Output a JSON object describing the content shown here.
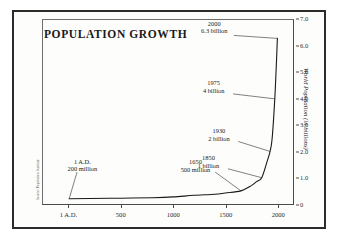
{
  "chart_data": {
    "type": "line",
    "title": "POPULATION GROWTH",
    "xlabel": "",
    "ylabel": "World Population (in billions)",
    "xlim": [
      -250,
      2150
    ],
    "ylim": [
      0,
      7.0
    ],
    "grid": false,
    "legend_position": "none",
    "x_ticks": [
      {
        "value": 1,
        "label": "1 A.D."
      },
      {
        "value": 500,
        "label": "500"
      },
      {
        "value": 1000,
        "label": "1000"
      },
      {
        "value": 1500,
        "label": "1500"
      },
      {
        "value": 2000,
        "label": "2000"
      }
    ],
    "y_ticks": [
      {
        "value": 0,
        "label": "0"
      },
      {
        "value": 1.0,
        "label": "1.0"
      },
      {
        "value": 2.0,
        "label": "2.0"
      },
      {
        "value": 3.0,
        "label": "3.0"
      },
      {
        "value": 4.0,
        "label": "4.0"
      },
      {
        "value": 5.0,
        "label": "5.0"
      },
      {
        "value": 6.0,
        "label": "6.0"
      },
      {
        "value": 7.0,
        "label": "7.0"
      }
    ],
    "series": [
      {
        "name": "World Population",
        "units": "billions",
        "points": [
          {
            "x": 1,
            "y": 0.2
          },
          {
            "x": 200,
            "y": 0.21
          },
          {
            "x": 500,
            "y": 0.22
          },
          {
            "x": 800,
            "y": 0.24
          },
          {
            "x": 1000,
            "y": 0.27
          },
          {
            "x": 1200,
            "y": 0.33
          },
          {
            "x": 1400,
            "y": 0.37
          },
          {
            "x": 1500,
            "y": 0.42
          },
          {
            "x": 1650,
            "y": 0.5
          },
          {
            "x": 1750,
            "y": 0.7
          },
          {
            "x": 1800,
            "y": 0.85
          },
          {
            "x": 1850,
            "y": 1.0
          },
          {
            "x": 1900,
            "y": 1.6
          },
          {
            "x": 1930,
            "y": 2.0
          },
          {
            "x": 1950,
            "y": 2.5
          },
          {
            "x": 1975,
            "y": 4.0
          },
          {
            "x": 1990,
            "y": 5.3
          },
          {
            "x": 2000,
            "y": 6.3
          }
        ]
      }
    ],
    "annotations": [
      {
        "name": "annot-1ad",
        "year": "1 A.D.",
        "amount": "200 million",
        "x": 1,
        "y": 0.2
      },
      {
        "name": "annot-1650",
        "year": "1650",
        "amount": "500 million",
        "x": 1650,
        "y": 0.5
      },
      {
        "name": "annot-1850",
        "year": "1850",
        "amount": "1 billion",
        "x": 1850,
        "y": 1.0
      },
      {
        "name": "annot-1930",
        "year": "1930",
        "amount": "2 billion",
        "x": 1930,
        "y": 2.0
      },
      {
        "name": "annot-1975",
        "year": "1975",
        "amount": "4 billion",
        "x": 1975,
        "y": 4.0
      },
      {
        "name": "annot-2000",
        "year": "2000",
        "amount": "6.3 billion",
        "x": 2000,
        "y": 6.3
      }
    ]
  },
  "source_credit": "Source: Population Institute",
  "colors": {
    "outer_border": "#2b2b2b",
    "plot_frame": "#4a4a4a",
    "curve": "#1a1a1a",
    "text": "#1a1a1a",
    "background": "#fdfdfb"
  }
}
